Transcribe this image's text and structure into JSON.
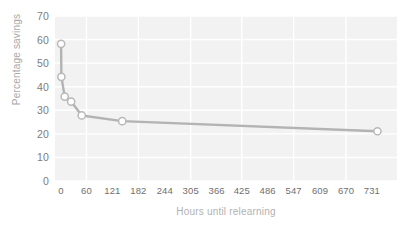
{
  "chart_data": {
    "type": "line",
    "title": "",
    "xlabel": "Hours until relearning",
    "ylabel": "Percentage savings",
    "x": [
      0.33,
      1,
      8.8,
      24,
      48.8,
      144,
      744
    ],
    "values": [
      58.2,
      44.2,
      35.8,
      33.7,
      27.8,
      25.4,
      21.1
    ],
    "xlim": [
      -14,
      790
    ],
    "ylim": [
      0,
      70
    ],
    "xticks": [
      0,
      60,
      121,
      182,
      244,
      305,
      366,
      425,
      486,
      547,
      609,
      670,
      731
    ],
    "yticks": [
      0,
      10,
      20,
      30,
      40,
      50,
      60,
      70
    ],
    "grid": true,
    "legend": "none",
    "series_name": "Percentage savings",
    "colors": {
      "line": "#b3b3b3",
      "marker_fill": "#ffffff",
      "marker_edge": "#b8b8b8",
      "plot_background": "#f2f2f2",
      "gridline": "#ffffff",
      "tick_label": "#7d7d7d",
      "axis_title": "#b0b0b0",
      "page_background": "#ffffff"
    }
  }
}
